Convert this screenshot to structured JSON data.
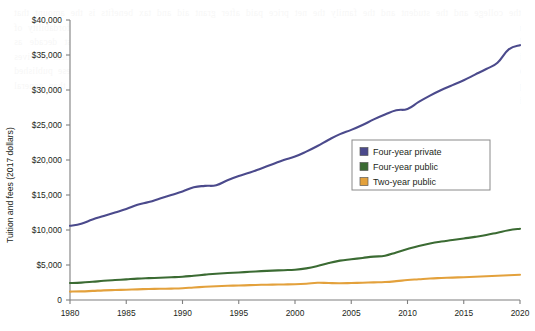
{
  "chart_data": {
    "type": "line",
    "title": "",
    "xlabel": "",
    "ylabel": "Tuition and fees (2017 dollars)",
    "xlim": [
      1980,
      2020
    ],
    "ylim": [
      0,
      40000
    ],
    "grid": false,
    "legend_position": "inside-right",
    "x_ticks": [
      "1980",
      "1985",
      "1990",
      "1995",
      "2000",
      "2005",
      "2010",
      "2015",
      "2020"
    ],
    "y_ticks": [
      "0",
      "$5,000",
      "$10,000",
      "$15,000",
      "$20,000",
      "$25,000",
      "$30,000",
      "$35,000",
      "$40,000"
    ],
    "x": [
      1980,
      1981,
      1982,
      1983,
      1984,
      1985,
      1986,
      1987,
      1988,
      1989,
      1990,
      1991,
      1992,
      1993,
      1994,
      1995,
      1996,
      1997,
      1998,
      1999,
      2000,
      2001,
      2002,
      2003,
      2004,
      2005,
      2006,
      2007,
      2008,
      2009,
      2010,
      2011,
      2012,
      2013,
      2014,
      2015,
      2016,
      2017,
      2018,
      2019,
      2020
    ],
    "series": [
      {
        "name": "Four-year private",
        "color": "#4b4a8c",
        "values": [
          10600,
          10900,
          11500,
          12000,
          12500,
          13000,
          13600,
          14000,
          14500,
          15000,
          15500,
          16100,
          16300,
          16400,
          17100,
          17700,
          18200,
          18800,
          19400,
          20000,
          20500,
          21200,
          22000,
          22900,
          23700,
          24300,
          25000,
          25800,
          26500,
          27100,
          27300,
          28300,
          29200,
          30000,
          30700,
          31400,
          32200,
          33000,
          33900,
          35800,
          36400
        ]
      },
      {
        "name": "Four-year public",
        "color": "#3b6b33",
        "values": [
          2420,
          2480,
          2600,
          2740,
          2850,
          2950,
          3050,
          3120,
          3180,
          3240,
          3320,
          3470,
          3620,
          3760,
          3850,
          3930,
          4030,
          4120,
          4200,
          4260,
          4330,
          4520,
          4850,
          5280,
          5620,
          5820,
          6010,
          6200,
          6320,
          6800,
          7270,
          7720,
          8080,
          8350,
          8560,
          8790,
          9020,
          9280,
          9620,
          9960,
          10180
        ]
      },
      {
        "name": "Two-year public",
        "color": "#e3a13c",
        "values": [
          1200,
          1230,
          1300,
          1380,
          1430,
          1470,
          1520,
          1570,
          1600,
          1630,
          1680,
          1790,
          1890,
          1970,
          2030,
          2070,
          2120,
          2170,
          2200,
          2220,
          2250,
          2330,
          2460,
          2420,
          2400,
          2430,
          2470,
          2520,
          2570,
          2690,
          2850,
          2960,
          3070,
          3140,
          3200,
          3260,
          3320,
          3390,
          3460,
          3540,
          3600
        ]
      }
    ]
  },
  "legend": {
    "items": [
      {
        "label": "Four-year private",
        "color": "#4b4a8c"
      },
      {
        "label": "Four-year public",
        "color": "#3b6b33"
      },
      {
        "label": "Two-year public",
        "color": "#e3a13c"
      }
    ]
  },
  "background": {
    "bleed_text": "the college and the student and the family the net price paid after grant aid and tax benefits is the amount that matters most for students deciding whether and where to enroll and for policymakers evaluating the affordability of higher education over time published prices have risen more rapidly than net prices over the past decade as institutional grant aid and federal support have grown in the public two year sector the average student receives enough grant aid to cover tuition and fees leaving living expenses as the primary cost of attendance these published price trends are reported in constant dollars so that comparisons across years reflect real changes rather than general inflation"
  }
}
